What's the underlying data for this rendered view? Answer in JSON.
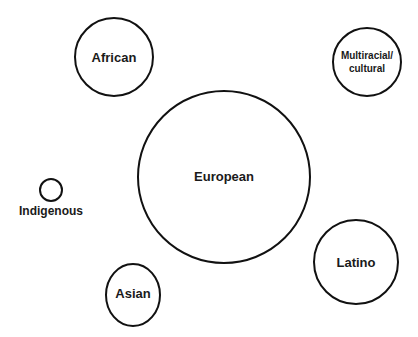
{
  "diagram": {
    "type": "bubble",
    "stroke_color": "#111111",
    "background": "#ffffff",
    "bubbles": [
      {
        "label": "African",
        "cx": 114,
        "cy": 57,
        "r": 39,
        "font_size": 13
      },
      {
        "label_lines": [
          "Multiracial/",
          "cultural"
        ],
        "cx": 367,
        "cy": 62,
        "r": 34,
        "font_size": 10
      },
      {
        "label": "Indigenous",
        "cx": 51,
        "cy": 190,
        "r": 11,
        "font_size": 12,
        "label_below": true
      },
      {
        "label": "European",
        "cx": 224,
        "cy": 177,
        "r": 87,
        "font_size": 13
      },
      {
        "label": "Latino",
        "cx": 356,
        "cy": 262,
        "r": 42,
        "font_size": 13
      },
      {
        "label": "Asian",
        "cx": 133,
        "cy": 294,
        "r": 28,
        "font_size": 13
      }
    ]
  },
  "labels": {
    "african": "African",
    "multiracial_1": "Multiracial/",
    "multiracial_2": "cultural",
    "indigenous": "Indigenous",
    "european": "European",
    "latino": "Latino",
    "asian": "Asian"
  }
}
